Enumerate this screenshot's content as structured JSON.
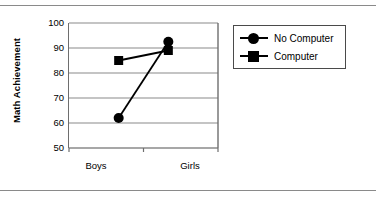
{
  "chart_data": {
    "type": "line",
    "title": "",
    "xlabel": "",
    "ylabel": "Math Achievement",
    "categories": [
      "Boys",
      "Girls"
    ],
    "ylim": [
      50,
      100
    ],
    "yticks": [
      50,
      60,
      70,
      80,
      90,
      100
    ],
    "grid": true,
    "grid_axis": "y",
    "legend_position": "right",
    "series": [
      {
        "name": "No Computer",
        "marker": "circle",
        "color": "#000000",
        "values": [
          62,
          92.5
        ]
      },
      {
        "name": "Computer",
        "marker": "square",
        "color": "#000000",
        "values": [
          85,
          89
        ]
      }
    ]
  },
  "axes": {
    "y_title": "Math Achievement",
    "y_tick_labels": [
      "100",
      "90",
      "80",
      "70",
      "60",
      "50"
    ],
    "x_tick_labels": [
      "Boys",
      "Girls"
    ]
  },
  "legend": {
    "entries": [
      {
        "label": "No Computer",
        "marker": "circle-marker"
      },
      {
        "label": "Computer",
        "marker": "square-marker"
      }
    ]
  },
  "colors": {
    "series": "#000000",
    "gridline": "#8a8a8a",
    "axis": "#6e6e6e",
    "frame_rule": "#8a8a8a"
  }
}
